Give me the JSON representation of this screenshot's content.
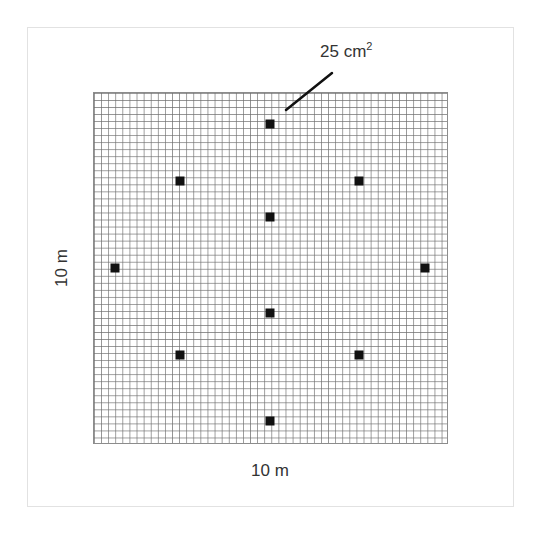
{
  "diagram": {
    "type": "sampling-grid",
    "grid": {
      "rows": 50,
      "columns": 50,
      "line_color": "#6e6e6e"
    },
    "labels": {
      "width": "10 m",
      "height": "10 m",
      "callout_value": "25 cm",
      "callout_exponent": "2"
    },
    "marker_color": "#111111",
    "markers": [
      {
        "id": "top",
        "x": 270,
        "y": 124
      },
      {
        "id": "upper-left",
        "x": 180,
        "y": 181
      },
      {
        "id": "upper-right",
        "x": 359,
        "y": 181
      },
      {
        "id": "center-upper",
        "x": 270,
        "y": 217
      },
      {
        "id": "left",
        "x": 115,
        "y": 268
      },
      {
        "id": "right",
        "x": 425,
        "y": 268
      },
      {
        "id": "center-lower",
        "x": 270,
        "y": 313
      },
      {
        "id": "lower-left",
        "x": 180,
        "y": 355
      },
      {
        "id": "lower-right",
        "x": 359,
        "y": 355
      },
      {
        "id": "bottom",
        "x": 270,
        "y": 421
      }
    ],
    "callout_line": {
      "x1": 332,
      "y1": 73,
      "x2": 286,
      "y2": 110
    }
  }
}
